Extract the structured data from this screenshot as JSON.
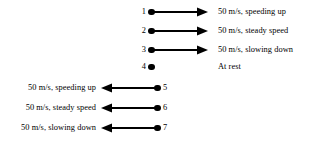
{
  "figure": {
    "title": "",
    "stroke_color": "#000000",
    "background_color": "#ffffff"
  },
  "rows": [
    {
      "index": "1",
      "direction": "right",
      "label": "50 m/s, speeding up",
      "has_arrow": true
    },
    {
      "index": "2",
      "direction": "right",
      "label": "50 m/s, steady speed",
      "has_arrow": true
    },
    {
      "index": "3",
      "direction": "right",
      "label": "50 m/s, slowing down",
      "has_arrow": true
    },
    {
      "index": "4",
      "direction": "none",
      "label": "At rest",
      "has_arrow": false
    },
    {
      "index": "5",
      "direction": "left",
      "label": "50 m/s, speeding up",
      "has_arrow": true
    },
    {
      "index": "6",
      "direction": "left",
      "label": "50 m/s, steady speed",
      "has_arrow": true
    },
    {
      "index": "7",
      "direction": "left",
      "label": "50 m/s, slowing down",
      "has_arrow": true
    }
  ]
}
